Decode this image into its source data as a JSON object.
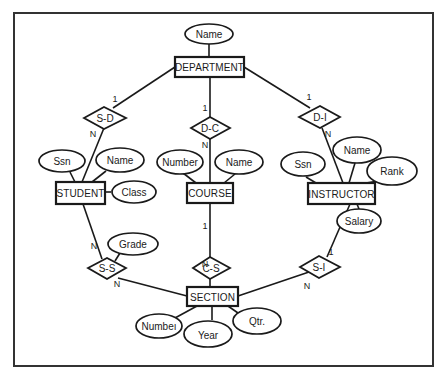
{
  "diagram": {
    "type": "er-diagram",
    "entities": [
      {
        "id": "department",
        "label": "DEPARTMENT"
      },
      {
        "id": "student",
        "label": "STUDENT"
      },
      {
        "id": "course",
        "label": "COURSE"
      },
      {
        "id": "instructor",
        "label": "INSTRUCTOR"
      },
      {
        "id": "section",
        "label": "SECTION"
      }
    ],
    "attributes": {
      "department": [
        {
          "label": "Name"
        }
      ],
      "student": [
        {
          "label": "Ssn"
        },
        {
          "label": "Name"
        },
        {
          "label": "Class"
        }
      ],
      "course": [
        {
          "label": "Number"
        },
        {
          "label": "Name"
        }
      ],
      "instructor": [
        {
          "label": "Ssn"
        },
        {
          "label": "Name"
        },
        {
          "label": "Rank"
        },
        {
          "label": "Salary"
        }
      ],
      "section": [
        {
          "label": "Numbeı"
        },
        {
          "label": "Year"
        },
        {
          "label": "Qtr."
        }
      ],
      "s_s": [
        {
          "label": "Grade"
        }
      ]
    },
    "relationships": [
      {
        "id": "s_d",
        "label": "S-D",
        "card_a": "1",
        "card_b": "N",
        "between": [
          "DEPARTMENT",
          "STUDENT"
        ]
      },
      {
        "id": "d_c",
        "label": "D-C",
        "card_a": "1",
        "card_b": "N",
        "between": [
          "DEPARTMENT",
          "COURSE"
        ]
      },
      {
        "id": "d_i",
        "label": "D-I",
        "card_a": "1",
        "card_b": "N",
        "between": [
          "DEPARTMENT",
          "INSTRUCTOR"
        ]
      },
      {
        "id": "c_s",
        "label": "C-S",
        "card_a": "1",
        "card_b": "N",
        "between": [
          "COURSE",
          "SECTION"
        ]
      },
      {
        "id": "s_s",
        "label": "S-S",
        "card_a": "N",
        "card_b": "N",
        "between": [
          "STUDENT",
          "SECTION"
        ]
      },
      {
        "id": "s_i",
        "label": "S-I",
        "card_a": "1",
        "card_b": "N",
        "between": [
          "INSTRUCTOR",
          "SECTION"
        ]
      }
    ]
  }
}
